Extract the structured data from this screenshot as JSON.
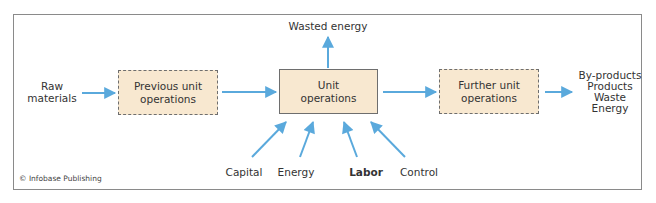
{
  "diagram": {
    "input_label_line1": "Raw",
    "input_label_line2": "materials",
    "boxes": [
      {
        "line1": "Previous unit",
        "line2": "operations",
        "style": "dashed"
      },
      {
        "line1": "Unit",
        "line2": "operations",
        "style": "solid"
      },
      {
        "line1": "Further unit",
        "line2": "operations",
        "style": "dashed"
      }
    ],
    "top_output": "Wasted energy",
    "outputs": [
      "By-products",
      "Products",
      "Waste",
      "Energy"
    ],
    "inputs_bottom": [
      {
        "label": "Capital",
        "bold": false
      },
      {
        "label": "Energy",
        "bold": false
      },
      {
        "label": "Labor",
        "bold": true
      },
      {
        "label": "Control",
        "bold": false
      }
    ],
    "credit": "© Infobase Publishing"
  },
  "colors": {
    "box_fill": "#f8e8d0",
    "arrow": "#5aa9dc",
    "border": "#8a8a8a",
    "text": "#333333"
  }
}
